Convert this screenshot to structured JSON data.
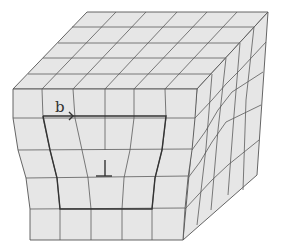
{
  "diagram": {
    "labels": {
      "burgers_vector": "b",
      "dislocation_symbol": "⊥"
    },
    "colors": {
      "cell_fill": "#e6e6e6",
      "grid_line": "#5a5a5a",
      "burgers_circuit": "#333333",
      "background": "#ffffff"
    }
  }
}
